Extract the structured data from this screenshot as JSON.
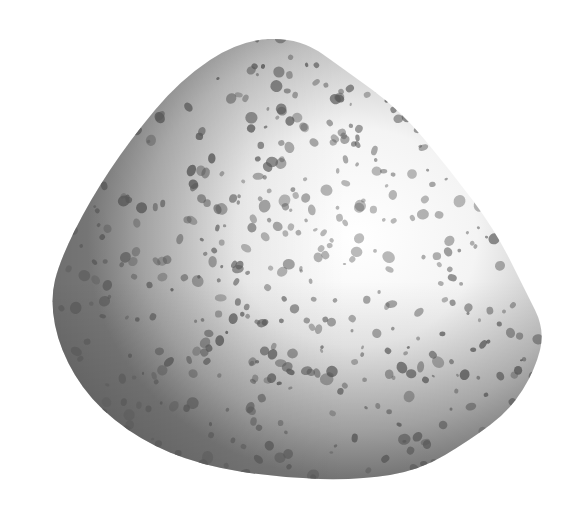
{
  "image": {
    "subject": "speckled stone",
    "background_color": "#ffffff",
    "stone": {
      "base_color": "#bdbdbd",
      "shadow_color": "#8a8a8a",
      "highlight_color": "#ffffff",
      "speckle_color": "#5a5a5a",
      "outline": [
        [
          240,
          40
        ],
        [
          300,
          38
        ],
        [
          345,
          70
        ],
        [
          400,
          110
        ],
        [
          450,
          170
        ],
        [
          495,
          230
        ],
        [
          525,
          290
        ],
        [
          545,
          330
        ],
        [
          535,
          370
        ],
        [
          510,
          410
        ],
        [
          470,
          440
        ],
        [
          420,
          470
        ],
        [
          360,
          480
        ],
        [
          280,
          478
        ],
        [
          200,
          465
        ],
        [
          140,
          440
        ],
        [
          90,
          400
        ],
        [
          60,
          350
        ],
        [
          50,
          300
        ],
        [
          60,
          260
        ],
        [
          90,
          200
        ],
        [
          130,
          140
        ],
        [
          180,
          80
        ]
      ]
    }
  }
}
